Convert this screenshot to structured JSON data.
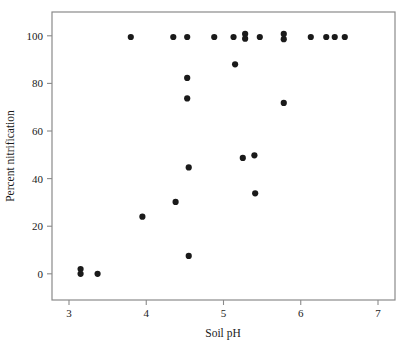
{
  "chart_data": {
    "type": "scatter",
    "title": "",
    "xlabel": "Soil pH",
    "ylabel": "Percent nitrification",
    "xlim": [
      2.78,
      7.22
    ],
    "ylim": [
      -11,
      110
    ],
    "xticks": [
      3,
      4,
      5,
      6,
      7
    ],
    "xtick_labels": [
      "3",
      "4",
      "5",
      "6",
      "7"
    ],
    "yticks": [
      0,
      20,
      40,
      60,
      80,
      100
    ],
    "ytick_labels": [
      "0",
      "20",
      "40",
      "60",
      "80",
      "100"
    ],
    "grid": false,
    "legend": null,
    "marker": {
      "shape": "circle",
      "color": "#1a1a1a",
      "size_px": 4.0
    },
    "frame_color": "#8a8a8a",
    "points": [
      {
        "x": 3.15,
        "y": 2.0
      },
      {
        "x": 3.15,
        "y": 0.0
      },
      {
        "x": 3.37,
        "y": 0.0
      },
      {
        "x": 3.8,
        "y": 99.5
      },
      {
        "x": 3.95,
        "y": 24.0
      },
      {
        "x": 4.35,
        "y": 99.5
      },
      {
        "x": 4.38,
        "y": 30.2
      },
      {
        "x": 4.53,
        "y": 99.5
      },
      {
        "x": 4.53,
        "y": 82.3
      },
      {
        "x": 4.53,
        "y": 73.7
      },
      {
        "x": 4.55,
        "y": 44.7
      },
      {
        "x": 4.55,
        "y": 7.5
      },
      {
        "x": 4.88,
        "y": 99.5
      },
      {
        "x": 5.13,
        "y": 99.5
      },
      {
        "x": 5.15,
        "y": 88.0
      },
      {
        "x": 5.25,
        "y": 48.7
      },
      {
        "x": 5.28,
        "y": 100.8
      },
      {
        "x": 5.28,
        "y": 98.8
      },
      {
        "x": 5.4,
        "y": 49.8
      },
      {
        "x": 5.41,
        "y": 33.8
      },
      {
        "x": 5.47,
        "y": 99.5
      },
      {
        "x": 5.78,
        "y": 100.8
      },
      {
        "x": 5.78,
        "y": 98.6
      },
      {
        "x": 5.78,
        "y": 71.8
      },
      {
        "x": 6.13,
        "y": 99.5
      },
      {
        "x": 6.33,
        "y": 99.5
      },
      {
        "x": 6.44,
        "y": 99.5
      },
      {
        "x": 6.57,
        "y": 99.5
      }
    ]
  }
}
